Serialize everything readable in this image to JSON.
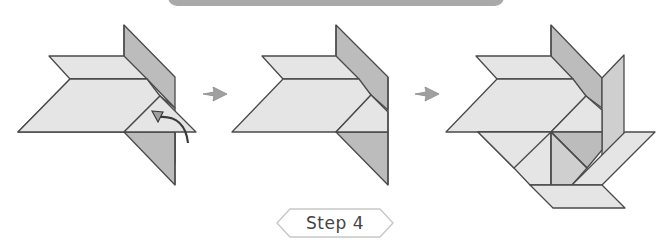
{
  "header": {
    "banner_color": "#a9a9a9"
  },
  "colors": {
    "light_piece": "#e5e5e5",
    "dark_piece": "#bcbcbc",
    "outline": "#4a4a4a",
    "arrow": "#a0a0a0"
  },
  "panels": [
    {
      "name": "panel-1",
      "description": "Tangram assembly with curved arrow indicating folding a triangle piece"
    },
    {
      "name": "panel-2",
      "description": "Triangle piece placed"
    },
    {
      "name": "panel-3",
      "description": "Completed step with additional pieces added"
    }
  ],
  "transition_arrows": [
    "right-arrow",
    "right-arrow"
  ],
  "step": {
    "label": "Step 4"
  }
}
